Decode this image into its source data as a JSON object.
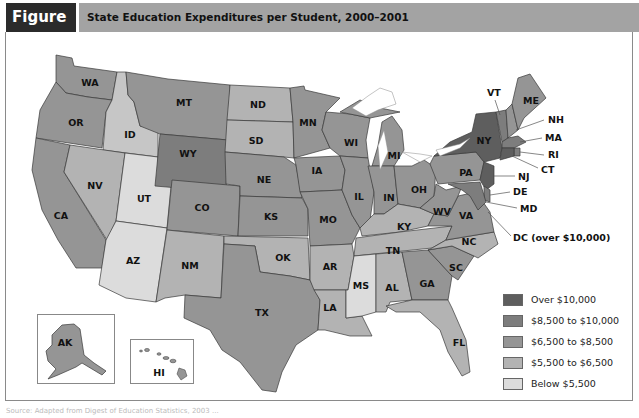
{
  "header": {
    "figure_label": "Figure 8.2",
    "title": "State Education Expenditures per Student, 2000–2001"
  },
  "colors": {
    "over_10000": "#5e5e5e",
    "8500_10000": "#7d7d7d",
    "6500_8500": "#959595",
    "5500_6500": "#b3b3b3",
    "below_5500": "#dcdcdc",
    "header_dark": "#2b2b2b",
    "header_light": "#a3a3a3"
  },
  "legend": {
    "items": [
      {
        "label": "Over $10,000",
        "color": "#5e5e5e"
      },
      {
        "label": "$8,500 to $10,000",
        "color": "#7d7d7d"
      },
      {
        "label": "$6,500 to $8,500",
        "color": "#959595"
      },
      {
        "label": "$5,500 to $6,500",
        "color": "#b3b3b3"
      },
      {
        "label": "Below $5,500",
        "color": "#dcdcdc"
      }
    ]
  },
  "states": {
    "WA": "WA",
    "OR": "OR",
    "CA": "CA",
    "ID": "ID",
    "NV": "NV",
    "UT": "UT",
    "AZ": "AZ",
    "MT": "MT",
    "WY": "WY",
    "CO": "CO",
    "NM": "NM",
    "ND": "ND",
    "SD": "SD",
    "NE": "NE",
    "KS": "KS",
    "OK": "OK",
    "TX": "TX",
    "MN": "MN",
    "IA": "IA",
    "MO": "MO",
    "AR": "AR",
    "LA": "LA",
    "WI": "WI",
    "IL": "IL",
    "MI": "MI",
    "IN": "IN",
    "OH": "OH",
    "KY": "KY",
    "TN": "TN",
    "MS": "MS",
    "AL": "AL",
    "GA": "GA",
    "FL": "FL",
    "SC": "SC",
    "NC": "NC",
    "VA": "VA",
    "WV": "WV",
    "PA": "PA",
    "NY": "NY",
    "VT": "VT",
    "NH": "NH",
    "ME": "ME",
    "MA": "MA",
    "RI": "RI",
    "CT": "CT",
    "NJ": "NJ",
    "DE": "DE",
    "MD": "MD",
    "DC": "DC (over $10,000)",
    "AK": "AK",
    "HI": "HI"
  },
  "source_line": "Source: Adapted from Digest of Education Statistics, 2003 ..."
}
